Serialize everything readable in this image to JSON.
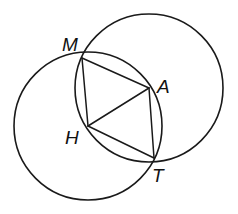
{
  "diagram": {
    "type": "geometry",
    "stroke_color": "#1a1a1a",
    "background": "#ffffff",
    "points": {
      "M": {
        "label": "M",
        "x": 82,
        "y": 58,
        "label_x": 62,
        "label_y": 51
      },
      "A": {
        "label": "A",
        "x": 149,
        "y": 88,
        "label_x": 157,
        "label_y": 93
      },
      "H": {
        "label": "H",
        "x": 88,
        "y": 126,
        "label_x": 65,
        "label_y": 144
      },
      "T": {
        "label": "T",
        "x": 154,
        "y": 158,
        "label_x": 152,
        "label_y": 182
      }
    },
    "circles": [
      {
        "name": "circle-centered-H",
        "center": "H",
        "cx": 88,
        "cy": 126,
        "r": 74
      },
      {
        "name": "circle-centered-A",
        "center": "A",
        "cx": 149,
        "cy": 88,
        "r": 74
      }
    ],
    "segments": [
      {
        "name": "segment-MA",
        "from": "M",
        "to": "A"
      },
      {
        "name": "segment-AT",
        "from": "A",
        "to": "T"
      },
      {
        "name": "segment-TH",
        "from": "T",
        "to": "H"
      },
      {
        "name": "segment-HM",
        "from": "H",
        "to": "M"
      },
      {
        "name": "segment-HA",
        "from": "H",
        "to": "A"
      }
    ]
  }
}
